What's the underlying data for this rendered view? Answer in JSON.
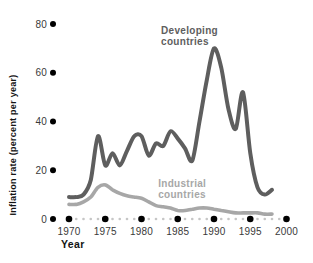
{
  "figure": {
    "x_axis_title": "Year",
    "y_axis_title": "Inflation rate (percent per year)"
  },
  "colors": {
    "developing_line": "#5e5e5e",
    "industrial_line": "#a7a7a7",
    "big_tick_dot": "#000000",
    "small_tick_dot": "#c6c6c6",
    "tick_text": "#3a3a3a",
    "axis_title_text": "#141414",
    "background": "#ffffff"
  },
  "chart_data": {
    "type": "line",
    "title": "",
    "xlabel": "Year",
    "ylabel": "Inflation rate (percent per year)",
    "x": [
      1970,
      1971,
      1972,
      1973,
      1974,
      1975,
      1976,
      1977,
      1978,
      1979,
      1980,
      1981,
      1982,
      1983,
      1984,
      1985,
      1986,
      1987,
      1988,
      1989,
      1990,
      1991,
      1992,
      1993,
      1994,
      1995,
      1996,
      1997,
      1998
    ],
    "series": [
      {
        "name": "Developing countries",
        "color": "#5e5e5e",
        "stroke_width": 4,
        "values": [
          9,
          9,
          10,
          16,
          34,
          22,
          27,
          22,
          28,
          34,
          34,
          26,
          31,
          30,
          36,
          33,
          29,
          24,
          40,
          57,
          70,
          62,
          45,
          37,
          52,
          27,
          13,
          10,
          12
        ]
      },
      {
        "name": "Industrial countries",
        "color": "#a7a7a7",
        "stroke_width": 3.6,
        "values": [
          6,
          6,
          7,
          9,
          13,
          14,
          12,
          10.5,
          9.5,
          9,
          8.5,
          7,
          5.5,
          5,
          4.5,
          3.5,
          3.5,
          4,
          4.5,
          4.5,
          4,
          3.5,
          3,
          2.5,
          2.5,
          2.5,
          2.5,
          2,
          2
        ]
      }
    ],
    "yticks": [
      0,
      20,
      40,
      60,
      80
    ],
    "xticks_major": [
      1970,
      1975,
      1980,
      1985,
      1990,
      1995,
      2000
    ],
    "xticks_minor_every_year": true,
    "xlim": [
      1970,
      2000
    ],
    "ylim": [
      0,
      80
    ],
    "grid": false,
    "legend_position": "none (direct labels on chart)",
    "annotations": [
      {
        "lines": [
          "Developing",
          "countries"
        ],
        "x": 1982.7,
        "y": 76,
        "color": "#5e5e5e"
      },
      {
        "lines": [
          "Industrial",
          "countries"
        ],
        "x": 1982.3,
        "y": 13,
        "color": "#a7a7a7"
      }
    ]
  }
}
